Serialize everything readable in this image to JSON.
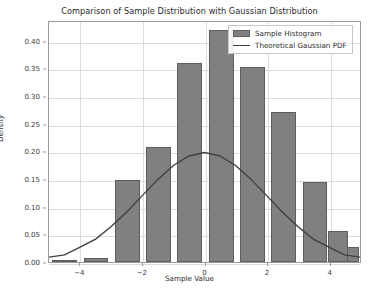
{
  "chart_data": {
    "type": "bar",
    "title": "Comparison of Sample Distribution with Gaussian Distribution",
    "xlabel": "Sample Value",
    "ylabel": "Density",
    "xlim": [
      -5,
      5
    ],
    "ylim": [
      0.0,
      0.4375
    ],
    "grid": true,
    "legend_position": "upper right",
    "xticks": [
      -4,
      -2,
      0,
      2,
      4
    ],
    "xtick_labels": [
      "−4",
      "−2",
      "0",
      "2",
      "4"
    ],
    "yticks": [
      0.0,
      0.05,
      0.1,
      0.15,
      0.2,
      0.25,
      0.3,
      0.35,
      0.4
    ],
    "ytick_labels": [
      "0.00",
      "0.05",
      "0.10",
      "0.15",
      "0.20",
      "0.25",
      "0.30",
      "0.35",
      "0.40"
    ],
    "series": [
      {
        "name": "Sample Histogram",
        "type": "bar",
        "color": "#808080",
        "edge_color": "#5e5e5e",
        "bin_edges": [
          -5,
          -4,
          -3,
          -2,
          -1,
          0,
          1,
          2,
          3,
          4,
          5
        ],
        "bin_centers": [
          -4.5,
          -3.5,
          -2.5,
          -1.5,
          -0.5,
          0.5,
          1.5,
          2.5,
          3.5,
          4.5
        ],
        "values": [
          0.004,
          0.008,
          0.148,
          0.208,
          0.36,
          0.42,
          0.352,
          0.272,
          0.145,
          0.027
        ]
      },
      {
        "name": "Theoretical Gaussian PDF",
        "type": "line",
        "color": "#404040",
        "mean": 0,
        "sigma": 2,
        "peak": 0.2,
        "x": [
          -5,
          -4.5,
          -4,
          -3.5,
          -3,
          -2.5,
          -2,
          -1.5,
          -1,
          -0.5,
          0,
          0.5,
          1,
          1.5,
          2,
          2.5,
          3,
          3.5,
          4,
          4.5,
          5
        ],
        "y": [
          0.0088,
          0.013,
          0.027,
          0.0417,
          0.0648,
          0.0913,
          0.121,
          0.1506,
          0.176,
          0.1933,
          0.1995,
          0.1933,
          0.176,
          0.1506,
          0.121,
          0.0913,
          0.0648,
          0.0417,
          0.027,
          0.013,
          0.0088
        ]
      }
    ],
    "extra_bar": {
      "note": "rightmost partial bar at x 4..5",
      "value": 0.056,
      "center": 4.2
    }
  },
  "legend": {
    "items": [
      {
        "label": "Sample Histogram",
        "marker": "patch"
      },
      {
        "label": "Theoretical Gaussian PDF",
        "marker": "line"
      }
    ]
  },
  "colors": {
    "bar_fill": "#808080",
    "bar_edge": "#5e5e5e",
    "curve": "#404040",
    "grid": "#dcdcdc",
    "axis": "#9a9a9a",
    "background": "#ffffff"
  }
}
